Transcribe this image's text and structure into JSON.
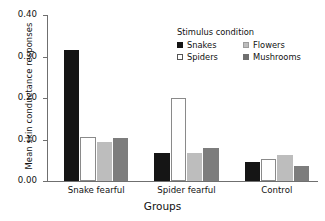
{
  "chart_data": {
    "type": "bar",
    "title": "",
    "xlabel": "Groups",
    "ylabel": "Mean skin conductance responses",
    "categories": [
      "Snake fearful",
      "Spider fearful",
      "Control"
    ],
    "ylim": [
      0.0,
      0.4
    ],
    "yticks": [
      "0.00",
      "0.10",
      "0.20",
      "0.30",
      "0.40"
    ],
    "ytick_values": [
      0.0,
      0.1,
      0.2,
      0.3,
      0.4
    ],
    "grid": false,
    "legend_position": "top-center-right",
    "legend_title": "Stimulus condition",
    "series": [
      {
        "name": "Snakes",
        "color": "#151515",
        "values": [
          0.315,
          0.068,
          0.046
        ]
      },
      {
        "name": "Spiders",
        "color": "#ffffff",
        "values": [
          0.107,
          0.2,
          0.054
        ]
      },
      {
        "name": "Flowers",
        "color": "#bdbdbd",
        "values": [
          0.095,
          0.068,
          0.063
        ]
      },
      {
        "name": "Mushrooms",
        "color": "#7d7d7d",
        "values": [
          0.104,
          0.079,
          0.035
        ]
      }
    ]
  },
  "legend": {
    "title": "Stimulus condition",
    "items": [
      {
        "label": "Snakes",
        "swatch": "snakes"
      },
      {
        "label": "Flowers",
        "swatch": "flowers"
      },
      {
        "label": "Spiders",
        "swatch": "spiders"
      },
      {
        "label": "Mushrooms",
        "swatch": "mushrooms"
      }
    ]
  },
  "axes": {
    "y_title": "Mean skin conductance responses",
    "x_title": "Groups"
  }
}
